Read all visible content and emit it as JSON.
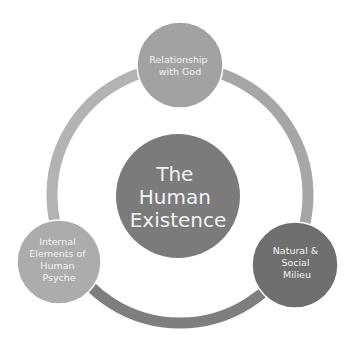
{
  "diagram": {
    "type": "cycle",
    "center": {
      "lines": [
        "The",
        "Human",
        "Existence"
      ],
      "color": "#7b7b7b"
    },
    "nodes": [
      {
        "id": "relationship-with-god",
        "lines": [
          "Relationship",
          "with God"
        ],
        "color": "#a2a2a2",
        "position": "top"
      },
      {
        "id": "natural-social-milieu",
        "lines": [
          "Natural &",
          "Social",
          "Milieu"
        ],
        "color": "#6f6f6f",
        "position": "bottom-right"
      },
      {
        "id": "internal-elements-human-psyche",
        "lines": [
          "Internal",
          "Elements of",
          "Human",
          "Psyche"
        ],
        "color": "#acacac",
        "position": "bottom-left"
      }
    ],
    "ring_segments": [
      {
        "from": "relationship-with-god",
        "to": "natural-social-milieu",
        "color": "#a6a6a6"
      },
      {
        "from": "natural-social-milieu",
        "to": "internal-elements-human-psyche",
        "color": "#7e7e7e"
      },
      {
        "from": "internal-elements-human-psyche",
        "to": "relationship-with-god",
        "color": "#b3b3b3"
      }
    ],
    "text_color": "#f2f2f2",
    "background": "#ffffff"
  }
}
